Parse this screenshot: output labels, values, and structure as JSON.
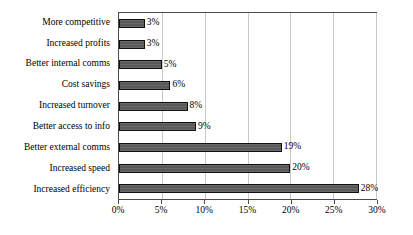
{
  "chart_data": {
    "type": "bar",
    "orientation": "horizontal",
    "title": "",
    "xlabel": "",
    "ylabel": "",
    "xlim": [
      0,
      30
    ],
    "xticks": [
      0,
      5,
      10,
      15,
      20,
      25,
      30
    ],
    "xtick_labels": [
      "0%",
      "5%",
      "10%",
      "15%",
      "20%",
      "25%",
      "30%"
    ],
    "grid": "vertical",
    "legend": "none",
    "value_suffix": "%",
    "categories": [
      "More competitive",
      "Increased profits",
      "Better internal comms",
      "Cost savings",
      "Increased turnover",
      "Better access to info",
      "Better external comms",
      "Increased speed",
      "Increased efficiency"
    ],
    "values": [
      3,
      3,
      5,
      6,
      8,
      9,
      19,
      20,
      28
    ],
    "data_labels": [
      "3%",
      "3%",
      "5%",
      "6%",
      "8%",
      "9%",
      "19%",
      "20%",
      "28%"
    ],
    "colors": {
      "bar_fill": "#595959",
      "bar_border": "#101010",
      "gridline": "#c9c9c9",
      "axis": "#4a4a4a",
      "background": "#ffffff",
      "text": "#000000"
    }
  }
}
